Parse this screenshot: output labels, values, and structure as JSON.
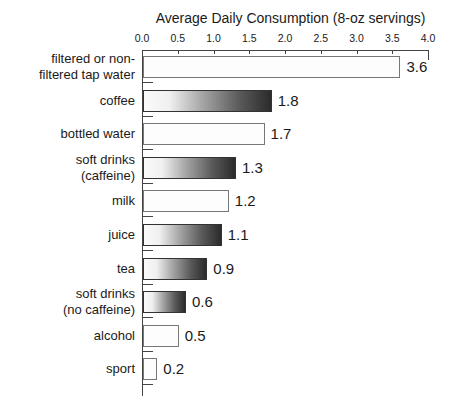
{
  "chart_data": {
    "type": "bar",
    "orientation": "horizontal",
    "title": "Average Daily Consumption (8-oz servings)",
    "xlabel": "Average Daily Consumption (8-oz servings)",
    "ylabel": "",
    "xlim": [
      0.0,
      4.0
    ],
    "x_ticks": [
      "0.0",
      "0.5",
      "1.0",
      "1.5",
      "2.0",
      "2.5",
      "3.0",
      "3.5",
      "4.0"
    ],
    "categories": [
      "filtered or non-filtered tap water",
      "coffee",
      "bottled water",
      "soft drinks (caffeine)",
      "milk",
      "juice",
      "tea",
      "soft drinks (no caffeine)",
      "alcohol",
      "sport"
    ],
    "values": [
      3.6,
      1.8,
      1.7,
      1.3,
      1.2,
      1.1,
      0.9,
      0.6,
      0.5,
      0.2
    ],
    "grid": false,
    "legend": null,
    "bars": [
      {
        "label_lines": [
          "filtered or non-",
          "filtered tap water"
        ],
        "value": 3.6,
        "value_label": "3.6",
        "style": "plain"
      },
      {
        "label_lines": [
          "coffee"
        ],
        "value": 1.8,
        "value_label": "1.8",
        "style": "gradient"
      },
      {
        "label_lines": [
          "bottled water"
        ],
        "value": 1.7,
        "value_label": "1.7",
        "style": "plain"
      },
      {
        "label_lines": [
          "soft drinks",
          "(caffeine)"
        ],
        "value": 1.3,
        "value_label": "1.3",
        "style": "gradient"
      },
      {
        "label_lines": [
          "milk"
        ],
        "value": 1.2,
        "value_label": "1.2",
        "style": "plain"
      },
      {
        "label_lines": [
          "juice"
        ],
        "value": 1.1,
        "value_label": "1.1",
        "style": "gradient"
      },
      {
        "label_lines": [
          "tea"
        ],
        "value": 0.9,
        "value_label": "0.9",
        "style": "gradient"
      },
      {
        "label_lines": [
          "soft drinks",
          "(no caffeine)"
        ],
        "value": 0.6,
        "value_label": "0.6",
        "style": "gradient"
      },
      {
        "label_lines": [
          "alcohol"
        ],
        "value": 0.5,
        "value_label": "0.5",
        "style": "plain"
      },
      {
        "label_lines": [
          "sport"
        ],
        "value": 0.2,
        "value_label": "0.2",
        "style": "plain"
      }
    ]
  }
}
